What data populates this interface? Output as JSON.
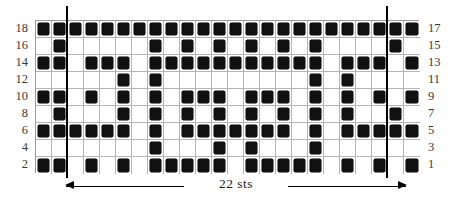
{
  "chart_data": {
    "type": "heatmap",
    "columns": 24,
    "rows": 9,
    "xlabel": "22 sts",
    "ylabel": "",
    "legend": [
      {
        "symbol": "filled-square",
        "meaning": "worked stitch",
        "color": "#111111"
      },
      {
        "symbol": "empty-square",
        "meaning": "plain stitch",
        "color": "#ffffff"
      }
    ],
    "left_row_labels": [
      "18",
      "16",
      "14",
      "12",
      "10",
      "8",
      "6",
      "4",
      "2"
    ],
    "right_row_labels": [
      "17",
      "15",
      "13",
      "11",
      "9",
      "7",
      "5",
      "3",
      "1"
    ],
    "repeat_marker_columns": [
      2,
      22
    ],
    "grid": true,
    "matrix": [
      [
        1,
        1,
        1,
        1,
        1,
        1,
        1,
        1,
        1,
        1,
        1,
        1,
        1,
        1,
        1,
        1,
        1,
        1,
        1,
        1,
        1,
        1,
        1,
        1
      ],
      [
        0,
        1,
        0,
        0,
        0,
        0,
        0,
        1,
        0,
        1,
        0,
        1,
        0,
        1,
        0,
        1,
        0,
        1,
        0,
        0,
        0,
        0,
        1,
        0
      ],
      [
        1,
        1,
        0,
        1,
        1,
        1,
        0,
        1,
        1,
        1,
        1,
        1,
        1,
        1,
        1,
        1,
        1,
        1,
        0,
        1,
        1,
        1,
        0,
        1
      ],
      [
        0,
        0,
        0,
        0,
        0,
        1,
        0,
        1,
        0,
        0,
        0,
        0,
        0,
        0,
        0,
        0,
        0,
        1,
        0,
        1,
        0,
        0,
        0,
        0
      ],
      [
        1,
        1,
        0,
        1,
        0,
        1,
        0,
        1,
        0,
        1,
        1,
        1,
        0,
        1,
        1,
        1,
        0,
        1,
        0,
        1,
        0,
        1,
        0,
        1
      ],
      [
        0,
        1,
        0,
        0,
        0,
        1,
        0,
        1,
        0,
        1,
        0,
        1,
        0,
        1,
        0,
        1,
        0,
        1,
        0,
        1,
        0,
        0,
        1,
        0
      ],
      [
        1,
        1,
        1,
        1,
        1,
        1,
        0,
        1,
        0,
        1,
        1,
        1,
        1,
        1,
        1,
        1,
        0,
        1,
        0,
        1,
        1,
        1,
        1,
        1
      ],
      [
        0,
        0,
        0,
        0,
        0,
        0,
        0,
        1,
        0,
        0,
        0,
        1,
        0,
        1,
        0,
        0,
        0,
        1,
        0,
        0,
        0,
        0,
        0,
        0
      ],
      [
        1,
        1,
        0,
        1,
        0,
        1,
        0,
        1,
        1,
        1,
        1,
        1,
        0,
        1,
        1,
        1,
        1,
        1,
        0,
        1,
        0,
        1,
        0,
        1
      ]
    ]
  },
  "annotation": {
    "width_label": "22 sts"
  }
}
